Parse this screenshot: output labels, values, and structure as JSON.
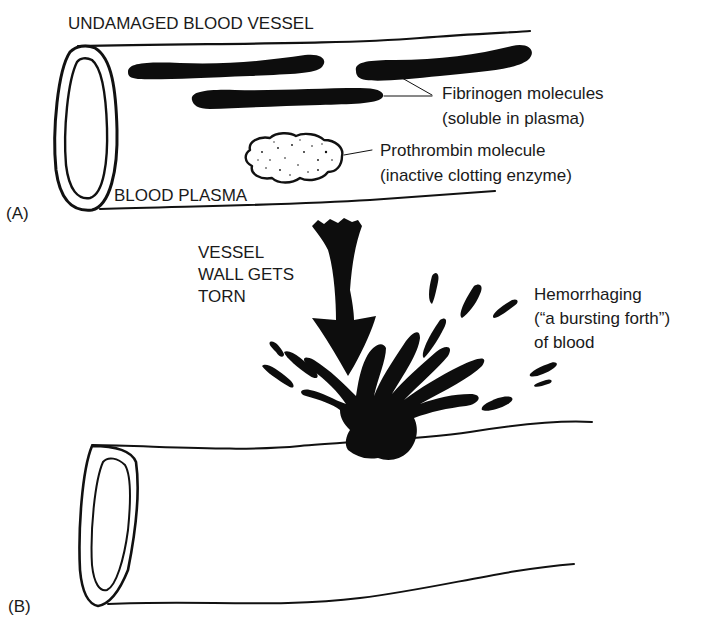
{
  "diagram": {
    "panel_a": {
      "panel_label": "(A)",
      "title": "UNDAMAGED BLOOD VESSEL",
      "plasma_label": "BLOOD PLASMA",
      "fibrinogen_label": {
        "line1": "Fibrinogen molecules",
        "line2": "(soluble in plasma)"
      },
      "prothrombin_label": {
        "line1": "Prothrombin molecule",
        "line2": "(inactive clotting enzyme)"
      }
    },
    "panel_b": {
      "panel_label": "(B)",
      "tear_label": {
        "line1": "VESSEL",
        "line2": "WALL GETS",
        "line3": "TORN"
      },
      "hemorrhage_label": {
        "line1": "Hemorrhaging",
        "line2": "(“a bursting forth”)",
        "line3": "of blood"
      }
    },
    "colors": {
      "ink": "#0d0d0d",
      "background": "#ffffff"
    }
  }
}
